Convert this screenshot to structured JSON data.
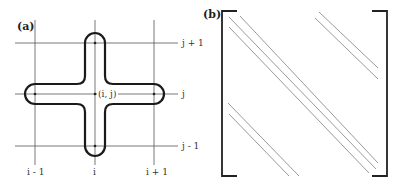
{
  "panel_a": {
    "label": "(a)",
    "grid": {
      "columns": [
        "i - 1",
        "i",
        "i + 1"
      ],
      "rows": [
        "j + 1",
        "j",
        "j - 1"
      ]
    },
    "center_label": "(i, j)",
    "shape": "cross-shaped stencil outline covering (i,j), (i-1,j), (i+1,j), (i,j-1), (i,j+1)"
  },
  "panel_b": {
    "label": "(b)",
    "description": "banded sparse matrix with three main diagonals, two upper off-diagonals and two lower off-diagonals"
  },
  "colors": {
    "outline": "#1a1a1a",
    "grid": "#555555",
    "diagonal": "#9a9a9a"
  }
}
